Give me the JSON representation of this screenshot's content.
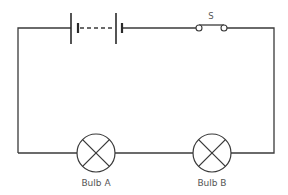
{
  "diagram": {
    "type": "series-circuit",
    "colors": {
      "wire": "#3a3a3a",
      "label": "#555555",
      "background": "#ffffff"
    },
    "battery": {
      "cells": 2,
      "joined_by": "dashed-line"
    },
    "switch": {
      "label": "S",
      "state": "closed"
    },
    "bulbs": [
      {
        "id": "A",
        "label": "Bulb A",
        "icon": "lamp-cross-icon"
      },
      {
        "id": "B",
        "label": "Bulb B",
        "icon": "lamp-cross-icon"
      }
    ]
  }
}
